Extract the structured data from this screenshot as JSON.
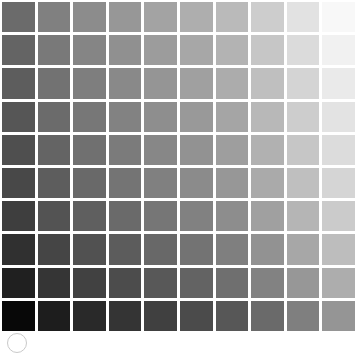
{
  "chart_data": {
    "type": "heatmap",
    "title": "",
    "subtitle": "",
    "xlabel": "",
    "ylabel": "",
    "grid": true,
    "legend": "none",
    "gridline_color": "#ffffff",
    "background_color": "#ffffff",
    "rows": 10,
    "columns": 10,
    "x": [
      1,
      2,
      3,
      4,
      5,
      6,
      7,
      8,
      9,
      10
    ],
    "y": [
      1,
      2,
      3,
      4,
      5,
      6,
      7,
      8,
      9,
      10
    ],
    "value_range": [
      8,
      250
    ],
    "values": [
      [
        107,
        128,
        140,
        151,
        163,
        174,
        186,
        205,
        226,
        248
      ],
      [
        100,
        121,
        133,
        144,
        156,
        167,
        179,
        198,
        219,
        241
      ],
      [
        93,
        114,
        126,
        137,
        149,
        160,
        172,
        191,
        212,
        234
      ],
      [
        86,
        107,
        119,
        130,
        142,
        153,
        165,
        184,
        205,
        227
      ],
      [
        79,
        100,
        112,
        123,
        135,
        146,
        158,
        177,
        198,
        220
      ],
      [
        72,
        93,
        105,
        116,
        128,
        139,
        151,
        170,
        191,
        213
      ],
      [
        62,
        83,
        95,
        106,
        118,
        129,
        141,
        160,
        181,
        203
      ],
      [
        48,
        69,
        81,
        92,
        104,
        115,
        127,
        146,
        167,
        189
      ],
      [
        32,
        53,
        65,
        76,
        88,
        99,
        111,
        130,
        151,
        173
      ],
      [
        8,
        29,
        41,
        52,
        64,
        75,
        87,
        106,
        127,
        149
      ]
    ],
    "hex_values": [
      [
        "#6b6b6b",
        "#808080",
        "#8c8c8c",
        "#979797",
        "#a3a3a3",
        "#aeaeae",
        "#bababa",
        "#cdcdcd",
        "#e2e2e2",
        "#f8f8f8"
      ],
      [
        "#646464",
        "#797979",
        "#858585",
        "#909090",
        "#9c9c9c",
        "#a7a7a7",
        "#b3b3b3",
        "#c6c6c6",
        "#dbdbdb",
        "#f1f1f1"
      ],
      [
        "#5d5d5d",
        "#727272",
        "#7e7e7e",
        "#898989",
        "#959595",
        "#a0a0a0",
        "#acacac",
        "#bfbfbf",
        "#d4d4d4",
        "#eaeaea"
      ],
      [
        "#565656",
        "#6b6b6b",
        "#777777",
        "#828282",
        "#8e8e8e",
        "#999999",
        "#a5a5a5",
        "#b8b8b8",
        "#cdcdcd",
        "#e3e3e3"
      ],
      [
        "#4f4f4f",
        "#646464",
        "#707070",
        "#7b7b7b",
        "#878787",
        "#929292",
        "#9e9e9e",
        "#b1b1b1",
        "#c6c6c6",
        "#dcdcdc"
      ],
      [
        "#484848",
        "#5d5d5d",
        "#696969",
        "#747474",
        "#808080",
        "#8b8b8b",
        "#979797",
        "#aaaaaa",
        "#bfbfbf",
        "#d5d5d5"
      ],
      [
        "#3e3e3e",
        "#535353",
        "#5f5f5f",
        "#6a6a6a",
        "#767676",
        "#818181",
        "#8d8d8d",
        "#a0a0a0",
        "#b5b5b5",
        "#cbcbcb"
      ],
      [
        "#303030",
        "#454545",
        "#515151",
        "#5c5c5c",
        "#686868",
        "#737373",
        "#7f7f7f",
        "#929292",
        "#a7a7a7",
        "#bdbdbd"
      ],
      [
        "#202020",
        "#353535",
        "#414141",
        "#4c4c4c",
        "#585858",
        "#636363",
        "#6f6f6f",
        "#828282",
        "#979797",
        "#adadad"
      ],
      [
        "#080808",
        "#1d1d1d",
        "#292929",
        "#343434",
        "#404040",
        "#4b4b4b",
        "#575757",
        "#6a6a6a",
        "#7f7f7f",
        "#959595"
      ]
    ]
  },
  "annotations": {
    "circle_marker": {
      "name": "registration-circle",
      "color": "#c9c9c9"
    }
  }
}
